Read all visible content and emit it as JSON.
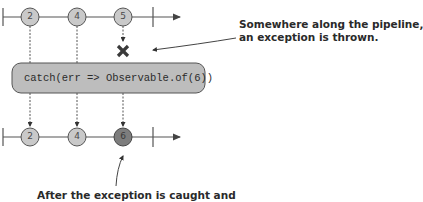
{
  "diagram": {
    "type": "marble-diagram",
    "top_stream": {
      "values": [
        "2",
        "4",
        "5"
      ],
      "error_marker": "x-icon"
    },
    "operator": {
      "label": "catch(err => Observable.of(6))"
    },
    "bottom_stream": {
      "values": [
        "2",
        "4",
        "6"
      ]
    },
    "annotations": {
      "error_note_line1": "Somewhere along the pipeline,",
      "error_note_line2": "an exception is thrown.",
      "recovery_note_line1": "After the exception is caught and"
    },
    "colors": {
      "marble_fill": "#c9c9c9",
      "marble_replacement_fill": "#7d7d7d",
      "operator_fill": "#bdbdbd",
      "stroke": "#555555"
    }
  }
}
